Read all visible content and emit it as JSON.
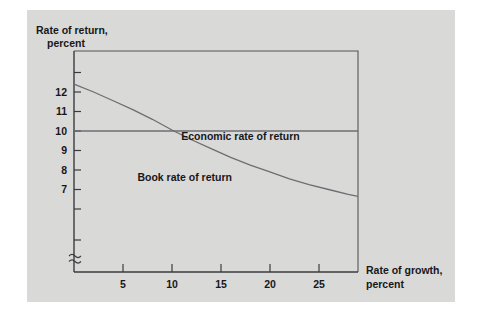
{
  "figure": {
    "background_color": "#d9d9d7",
    "page_color": "#ffffff",
    "frame_color": "#56565a",
    "axis_color": "#3b3b3f",
    "curve_color": "#6e6e72"
  },
  "chart_data": {
    "type": "line",
    "title": "",
    "xlabel": "Rate of growth, percent",
    "xlabel_line1": "Rate of growth,",
    "xlabel_line2": "percent",
    "ylabel": "Rate of return, percent",
    "ylabel_line1": "Rate of return,",
    "ylabel_line2": "percent",
    "xlim": [
      0,
      29
    ],
    "ylim": [
      6,
      13
    ],
    "grid": false,
    "legend_position": "inline-annotation",
    "y_axis_break": true,
    "y_axis_break_symbol": "≈",
    "xticks": [
      5,
      10,
      15,
      20,
      25
    ],
    "xtick_labels": [
      "5",
      "10",
      "15",
      "20",
      "25"
    ],
    "yticks": [
      6,
      7,
      8,
      9,
      10,
      11,
      12,
      13
    ],
    "ytick_labels": [
      "",
      "7",
      "8",
      "9",
      "10",
      "11",
      "12",
      ""
    ],
    "series": [
      {
        "name": "Economic rate of return",
        "label": "Economic rate of return",
        "label_x": 17.0,
        "label_y": 9.55,
        "x": [
          0,
          29
        ],
        "values": [
          10,
          10
        ]
      },
      {
        "name": "Book rate of return",
        "label": "Book rate of return",
        "label_x": 11.3,
        "label_y": 7.45,
        "x": [
          0,
          2,
          4,
          6,
          8,
          10,
          12,
          14,
          16,
          18,
          20,
          22,
          24,
          26,
          28,
          29
        ],
        "values": [
          12.4,
          12.0,
          11.55,
          11.1,
          10.6,
          10.05,
          9.55,
          9.1,
          8.65,
          8.25,
          7.9,
          7.55,
          7.25,
          7.0,
          6.75,
          6.65
        ]
      }
    ],
    "annotations": [
      {
        "text": "Economic rate of return",
        "x": 17.0,
        "y": 9.55
      },
      {
        "text": "Book rate of return",
        "x": 11.3,
        "y": 7.45
      }
    ]
  }
}
